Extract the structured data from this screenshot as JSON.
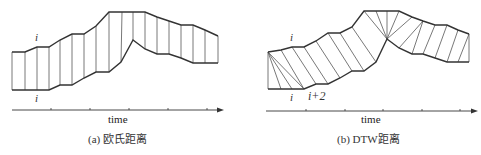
{
  "panels": [
    {
      "id": "euclidean",
      "caption": "(a) 欧氏距离",
      "axis_label": "time",
      "index_top": "i",
      "index_bottom": "i",
      "top_series": [
        [
          12,
          52
        ],
        [
          25,
          52
        ],
        [
          37,
          47
        ],
        [
          49,
          47
        ],
        [
          60,
          40
        ],
        [
          72,
          34
        ],
        [
          84,
          34
        ],
        [
          96,
          26
        ],
        [
          109,
          12
        ],
        [
          122,
          12
        ],
        [
          133,
          12
        ],
        [
          145,
          12
        ],
        [
          157,
          17
        ],
        [
          169,
          21
        ],
        [
          181,
          25
        ],
        [
          193,
          25
        ],
        [
          205,
          30
        ],
        [
          218,
          36
        ]
      ],
      "bottom_series": [
        [
          12,
          90
        ],
        [
          25,
          90
        ],
        [
          37,
          90
        ],
        [
          49,
          90
        ],
        [
          60,
          85
        ],
        [
          72,
          85
        ],
        [
          84,
          78
        ],
        [
          96,
          72
        ],
        [
          109,
          72
        ],
        [
          121,
          62
        ],
        [
          133,
          40
        ],
        [
          145,
          49
        ],
        [
          157,
          54
        ],
        [
          169,
          54
        ],
        [
          181,
          58
        ],
        [
          193,
          63
        ],
        [
          205,
          63
        ],
        [
          218,
          63
        ]
      ],
      "links": [
        [
          0,
          0
        ],
        [
          1,
          1
        ],
        [
          2,
          2
        ],
        [
          3,
          3
        ],
        [
          4,
          4
        ],
        [
          5,
          5
        ],
        [
          6,
          6
        ],
        [
          7,
          7
        ],
        [
          8,
          8
        ],
        [
          9,
          9
        ],
        [
          10,
          10
        ],
        [
          11,
          11
        ],
        [
          12,
          12
        ],
        [
          13,
          13
        ],
        [
          14,
          14
        ],
        [
          15,
          15
        ],
        [
          16,
          16
        ],
        [
          17,
          17
        ]
      ],
      "axis": {
        "x1": 12,
        "x2": 224,
        "y": 110,
        "ticks": [
          51,
          90,
          129,
          168,
          207
        ]
      }
    },
    {
      "id": "dtw",
      "caption": "(b) DTW距离",
      "axis_label": "time",
      "index_top": "i",
      "index_bottom": "i",
      "index_bottom_2": "i+2",
      "top_series": [
        [
          268,
          52
        ],
        [
          281,
          50
        ],
        [
          292,
          47
        ],
        [
          304,
          47
        ],
        [
          316,
          41
        ],
        [
          328,
          33
        ],
        [
          340,
          33
        ],
        [
          352,
          27
        ],
        [
          364,
          11
        ],
        [
          376,
          11
        ],
        [
          387,
          11
        ],
        [
          399,
          11
        ],
        [
          412,
          17
        ],
        [
          423,
          21
        ],
        [
          435,
          25
        ],
        [
          447,
          25
        ],
        [
          458,
          30
        ],
        [
          469,
          34
        ]
      ],
      "bottom_series": [
        [
          268,
          89
        ],
        [
          281,
          89
        ],
        [
          292,
          89
        ],
        [
          304,
          89
        ],
        [
          316,
          84
        ],
        [
          328,
          84
        ],
        [
          340,
          78
        ],
        [
          352,
          71
        ],
        [
          364,
          71
        ],
        [
          376,
          62
        ],
        [
          387,
          39
        ],
        [
          399,
          48
        ],
        [
          412,
          54
        ],
        [
          423,
          54
        ],
        [
          435,
          58
        ],
        [
          447,
          62
        ],
        [
          458,
          62
        ],
        [
          469,
          62
        ]
      ],
      "links": [
        [
          0,
          0
        ],
        [
          0,
          1
        ],
        [
          0,
          2
        ],
        [
          0,
          3
        ],
        [
          1,
          3
        ],
        [
          2,
          4
        ],
        [
          3,
          5
        ],
        [
          4,
          6
        ],
        [
          5,
          7
        ],
        [
          6,
          8
        ],
        [
          7,
          9
        ],
        [
          8,
          10
        ],
        [
          9,
          10
        ],
        [
          10,
          10
        ],
        [
          11,
          10
        ],
        [
          12,
          10
        ],
        [
          13,
          11
        ],
        [
          13,
          12
        ],
        [
          14,
          13
        ],
        [
          15,
          14
        ],
        [
          16,
          15
        ],
        [
          17,
          16
        ],
        [
          17,
          17
        ]
      ],
      "axis": {
        "x1": 266,
        "x2": 478,
        "y": 111,
        "ticks": [
          306,
          345,
          383,
          422,
          460
        ]
      }
    }
  ],
  "style": {
    "line_color": "#333333",
    "link_color": "#555555",
    "axis_color": "#333333"
  }
}
